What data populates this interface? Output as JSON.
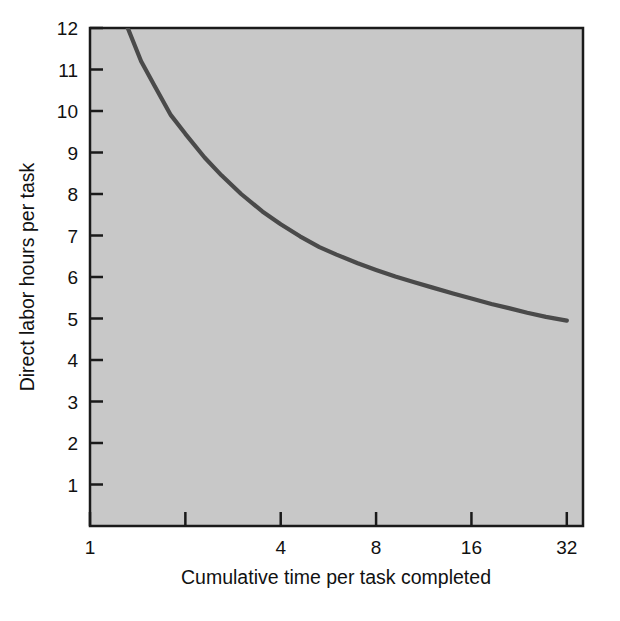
{
  "chart_data": {
    "type": "line",
    "title": "",
    "subtitle": "",
    "xlabel": "Cumulative time per task completed",
    "ylabel": "Direct labor hours per task",
    "xscale": "log2",
    "yscale": "linear",
    "xlim": [
      1,
      36
    ],
    "ylim": [
      0,
      12
    ],
    "grid": false,
    "legend": null,
    "x_ticks": [
      {
        "value": 1,
        "label": "1"
      },
      {
        "value": 2,
        "label": ""
      },
      {
        "value": 4,
        "label": "4"
      },
      {
        "value": 8,
        "label": "8"
      },
      {
        "value": 16,
        "label": "16"
      },
      {
        "value": 32,
        "label": "32"
      }
    ],
    "y_ticks": [
      {
        "value": 1,
        "label": "1"
      },
      {
        "value": 2,
        "label": "2"
      },
      {
        "value": 3,
        "label": "3"
      },
      {
        "value": 4,
        "label": "4"
      },
      {
        "value": 5,
        "label": "5"
      },
      {
        "value": 6,
        "label": "6"
      },
      {
        "value": 7,
        "label": "7"
      },
      {
        "value": 8,
        "label": "8"
      },
      {
        "value": 9,
        "label": "9"
      },
      {
        "value": 10,
        "label": "10"
      },
      {
        "value": 11,
        "label": "11"
      },
      {
        "value": 12,
        "label": "12"
      }
    ],
    "series": [
      {
        "name": "learning curve",
        "color": "#4a4a4a",
        "x": [
          1.0,
          1.05,
          1.1,
          1.2,
          1.3,
          1.45,
          1.6,
          1.8,
          2.0,
          2.3,
          2.6,
          3.0,
          3.5,
          4.0,
          4.6,
          5.3,
          6.0,
          7.0,
          8.0,
          9.2,
          10.5,
          12.0,
          14.0,
          16.0,
          18.5,
          21.0,
          24.0,
          27.5,
          32.0
        ],
        "y": [
          15.6,
          14.8,
          14.1,
          13.0,
          12.1,
          11.2,
          10.6,
          9.9,
          9.45,
          8.88,
          8.45,
          8.0,
          7.58,
          7.27,
          6.98,
          6.72,
          6.54,
          6.33,
          6.17,
          6.01,
          5.88,
          5.75,
          5.6,
          5.48,
          5.35,
          5.25,
          5.14,
          5.04,
          4.95
        ]
      }
    ]
  },
  "figure": {
    "plot_background_color": "#c8c8c8",
    "page_background_color": "#ffffff",
    "axis_color": "#1a1a1a",
    "line_color": "#4a4a4a",
    "text_color": "#111111"
  }
}
